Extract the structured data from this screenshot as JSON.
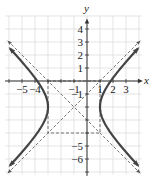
{
  "figure": {
    "type": "hyperbola-graph",
    "axes": {
      "x_label": "x",
      "y_label": "y"
    },
    "x_ticks": [
      {
        "value": -5,
        "label": "−5"
      },
      {
        "value": -4,
        "label": "−4"
      },
      {
        "value": -1,
        "label": "−1"
      },
      {
        "value": 1,
        "label": "1"
      },
      {
        "value": 2,
        "label": "2"
      },
      {
        "value": 3,
        "label": "3"
      }
    ],
    "y_ticks": [
      {
        "value": 4,
        "label": "4"
      },
      {
        "value": 3,
        "label": "3"
      },
      {
        "value": 2,
        "label": "2"
      },
      {
        "value": 1,
        "label": "1"
      },
      {
        "value": -1,
        "label": "−1"
      },
      {
        "value": -5,
        "label": "−5"
      },
      {
        "value": -6,
        "label": "−6"
      }
    ],
    "hyperbola": {
      "center": [
        -1,
        -2
      ],
      "a": 2,
      "b": 2,
      "orientation": "horizontal"
    },
    "fundamental_rectangle": {
      "x": [
        -3,
        1
      ],
      "y": [
        -4,
        0
      ]
    },
    "asymptotes": [
      "y + 2 = x + 1",
      "y + 2 = -(x + 1)"
    ],
    "colors": {
      "curve": "#444444",
      "grid": "#d8d8d8",
      "axis": "#333333",
      "dashed": "#555555"
    }
  }
}
